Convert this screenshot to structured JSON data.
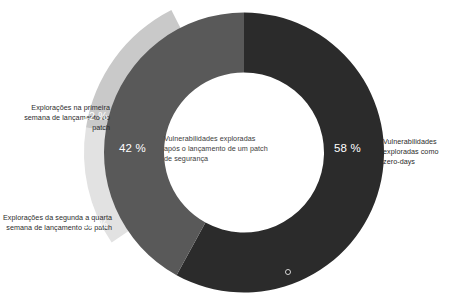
{
  "title": "",
  "chart_data": {
    "type": "pie",
    "title": "",
    "subtitle": "",
    "xlabel": "",
    "ylabel": "",
    "donut": true,
    "legend_position": "callout-labels",
    "grid": false,
    "inner_ring": {
      "categories": [
        "Vulnerabilidades exploradas como zero-days",
        "Vulnerabilidades exploradas após o lançamento de um patch de segurança"
      ],
      "values": [
        58,
        42
      ],
      "value_labels": [
        "58 %",
        "42 %"
      ],
      "colors": [
        "#2b2b2b",
        "#595959"
      ]
    },
    "outer_ring": {
      "categories": [
        "Explorações na primeira semana de lançamento do patch",
        "Explorações da segunda a quarta semana de lançamento do patch"
      ],
      "values": [
        12,
        15
      ],
      "value_labels": [
        "12 %",
        "15 %"
      ],
      "colors": [
        "#e2e2e2",
        "#c9c9c9"
      ]
    },
    "segments": [
      {
        "id": "zero-days",
        "label": "Vulnerabilidades exploradas como zero-days",
        "value": 58,
        "value_label": "58 %",
        "color": "#2b2b2b",
        "ring": "inner"
      },
      {
        "id": "after-patch",
        "label": "Vulnerabilidades exploradas após o lançamento de um patch de segurança",
        "value": 42,
        "value_label": "42 %",
        "color": "#595959",
        "ring": "inner"
      },
      {
        "id": "first-week",
        "label": "Explorações na primeira semana de lançamento do patch",
        "value": 12,
        "value_label": "12 %",
        "color": "#e2e2e2",
        "ring": "outer"
      },
      {
        "id": "second-to-fourth-week",
        "label": "Explorações da segunda a quarta semana de lançamento do patch",
        "value": 15,
        "value_label": "15 %",
        "color": "#c9c9c9",
        "ring": "outer"
      }
    ]
  },
  "labels": {
    "first_week": "Explorações na primeira semana de lançamento do patch",
    "second_to_fourth_week": "Explorações da segunda a quarta semana de lançamento do patch",
    "zero_days": "Vulnerabilidades exploradas como zero-days",
    "after_patch": "Vulnerabilidades exploradas após o lançamento de um patch de segurança"
  },
  "values": {
    "zero_days": "58 %",
    "after_patch": "42 %",
    "first_week": "12 %",
    "second_to_fourth_week": "15 %"
  },
  "colors": {
    "dark": "#2b2b2b",
    "medium": "#595959",
    "light": "#c9c9c9",
    "lightest": "#e2e2e2",
    "background": "#ffffff",
    "text": "#2b2b2b",
    "label_on_fill": "#ffffff"
  }
}
